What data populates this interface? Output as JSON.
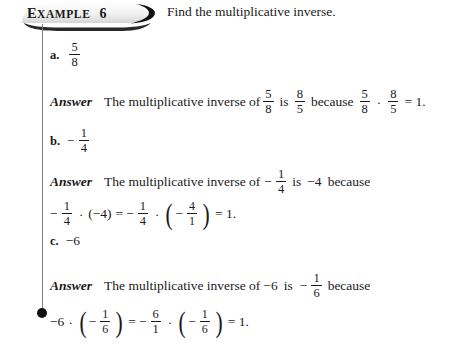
{
  "header": {
    "example_label_first": "E",
    "example_label_rest": "XAMPLE",
    "example_number": "6",
    "prompt": "Find the multiplicative inverse."
  },
  "problems": [
    {
      "label": "a.",
      "expression": {
        "type": "fraction",
        "numerator": "5",
        "denominator": "8"
      },
      "answer_label": "Answer",
      "answer_text_1": "The multiplicative inverse of",
      "answer_text_2": "is",
      "answer_text_3": "because",
      "inverse": {
        "numerator": "8",
        "denominator": "5"
      },
      "equation_result": "= 1.",
      "dot": "·"
    },
    {
      "label": "b.",
      "expression": {
        "type": "negative-fraction",
        "sign": "−",
        "numerator": "1",
        "denominator": "4"
      },
      "answer_label": "Answer",
      "answer_text_1": "The multiplicative inverse of",
      "answer_text_2": "is",
      "inverse_value": "−4",
      "answer_text_3": "because",
      "eq_left_sign": "−",
      "eq_left_num": "1",
      "eq_left_den": "4",
      "eq_factor": "(−4)",
      "eq_equals": "=",
      "eq_mid_sign": "−",
      "eq_mid_num": "1",
      "eq_mid_den": "4",
      "eq_paren_sign": "−",
      "eq_paren_num": "4",
      "eq_paren_den": "1",
      "equation_result": "= 1.",
      "dot": "·"
    },
    {
      "label": "c.",
      "expression": {
        "type": "integer",
        "value": "−6"
      },
      "answer_label": "Answer",
      "answer_text_1": "The multiplicative inverse of",
      "answer_value": "−6",
      "answer_text_2": "is",
      "inverse_sign": "−",
      "inverse_num": "1",
      "inverse_den": "6",
      "answer_text_3": "because",
      "eq_left_value": "−6",
      "eq_p1_sign": "−",
      "eq_p1_num": "1",
      "eq_p1_den": "6",
      "eq_equals": "=",
      "eq_mid_sign": "−",
      "eq_mid_num": "6",
      "eq_mid_den": "1",
      "eq_p2_sign": "−",
      "eq_p2_num": "1",
      "eq_p2_den": "6",
      "equation_result": "= 1.",
      "dot": "·"
    }
  ],
  "colors": {
    "rule": "#7d7d7d",
    "text": "#1a1a1a",
    "background": "#ffffff"
  }
}
